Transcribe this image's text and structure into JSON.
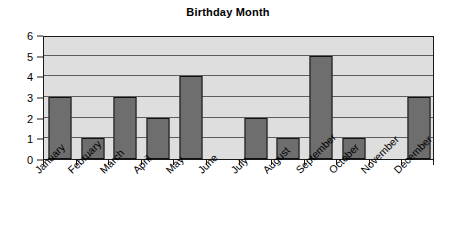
{
  "chart_data": {
    "type": "bar",
    "title": "Birthday Month",
    "xlabel": "",
    "ylabel": "",
    "categories": [
      "January",
      "February",
      "March",
      "April",
      "May",
      "June",
      "July",
      "August",
      "September",
      "October",
      "November",
      "December"
    ],
    "values": [
      3,
      1,
      3,
      2,
      4,
      0,
      2,
      1,
      5,
      1,
      0,
      3
    ],
    "ylim": [
      0,
      6
    ],
    "ytick_labels": [
      "0",
      "1",
      "2",
      "3",
      "4",
      "5",
      "6"
    ],
    "ytick_values": [
      0,
      1,
      2,
      3,
      4,
      5,
      6
    ],
    "grid": true,
    "legend": false,
    "series": [
      {
        "name": "Birthday Month",
        "values": [
          3,
          1,
          3,
          2,
          4,
          0,
          2,
          1,
          5,
          1,
          0,
          3
        ]
      }
    ],
    "colors": {
      "bar_fill": "#6e6e6e",
      "bar_border": "#111111",
      "plot_background": "#dedede",
      "gridline": "#5e5e5e",
      "axis": "#1a1a1a",
      "text": "#000000",
      "page_background": "#ffffff"
    }
  }
}
